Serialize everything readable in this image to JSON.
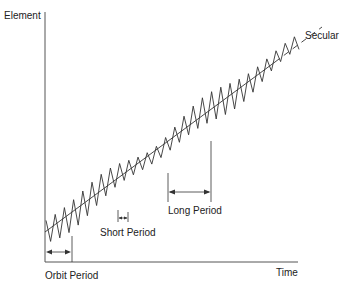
{
  "diagram": {
    "title": "",
    "y_axis_label": "Element",
    "x_axis_label": "Time",
    "trend_label": "Secular",
    "annotations": [
      {
        "label": "Orbit Period"
      },
      {
        "label": "Short Period"
      },
      {
        "label": "Long Period"
      }
    ],
    "colors": {
      "line": "#333333",
      "text": "#222222",
      "background": "#ffffff"
    }
  }
}
